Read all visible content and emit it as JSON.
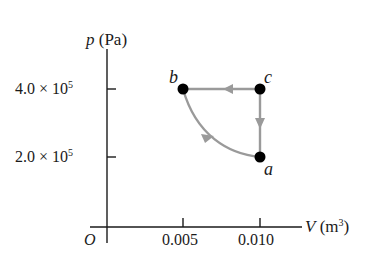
{
  "diagram": {
    "type": "pV-diagram",
    "y_axis": {
      "symbol": "p",
      "unit": "(Pa)"
    },
    "x_axis": {
      "symbol": "V",
      "unit": "(m",
      "unit_exp": "3",
      "unit_close": ")"
    },
    "origin_label": "O",
    "y_ticks": [
      {
        "mantissa": "4.0 × 10",
        "exp": "5",
        "value": 400000
      },
      {
        "mantissa": "2.0 × 10",
        "exp": "5",
        "value": 200000
      }
    ],
    "x_ticks": [
      {
        "label": "0.005",
        "value": 0.005
      },
      {
        "label": "0.010",
        "value": 0.01
      }
    ],
    "points": [
      {
        "name": "a",
        "V": 0.01,
        "p": 200000
      },
      {
        "name": "b",
        "V": 0.005,
        "p": 400000
      },
      {
        "name": "c",
        "V": 0.01,
        "p": 400000
      }
    ],
    "paths": [
      {
        "from": "b",
        "to": "c",
        "shape": "straight",
        "arrow": "right"
      },
      {
        "from": "c",
        "to": "a",
        "shape": "straight",
        "arrow": "down"
      },
      {
        "from": "a",
        "to": "b",
        "shape": "curve",
        "arrow": "up-left"
      }
    ],
    "colors": {
      "axis": "#1a1a1a",
      "path": "#9a9a9a",
      "point": "#000000"
    }
  }
}
